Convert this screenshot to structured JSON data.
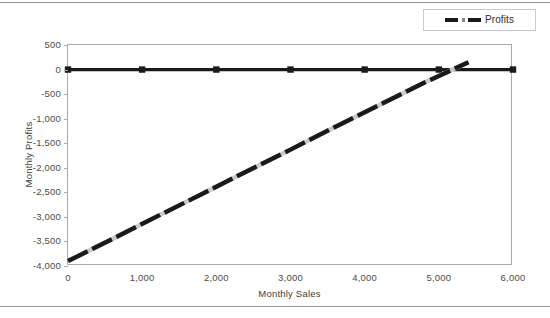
{
  "legend": {
    "position": "top-right",
    "entries": [
      {
        "label": "Profits",
        "marker": "dashed-line-swatch",
        "color": "#1a1a1a"
      }
    ]
  },
  "axes": {
    "x_title": "Monthly Sales",
    "y_title": "Monthly Profits",
    "x_ticks": [
      "0",
      "1,000",
      "2,000",
      "3,000",
      "4,000",
      "5,000",
      "6,000"
    ],
    "y_ticks": [
      "500",
      "0",
      "-500",
      "-1,000",
      "-1,500",
      "-2,000",
      "-2,500",
      "-3,000",
      "-3,500",
      "-4,000"
    ]
  },
  "chart_data": {
    "type": "line",
    "title": "",
    "xlabel": "Monthly Sales",
    "ylabel": "Monthly Profits",
    "xlim": [
      0,
      6000
    ],
    "ylim": [
      -4000,
      500
    ],
    "xticks": [
      0,
      1000,
      2000,
      3000,
      4000,
      5000,
      6000
    ],
    "yticks": [
      500,
      0,
      -500,
      -1000,
      -1500,
      -2000,
      -2500,
      -3000,
      -3500,
      -4000
    ],
    "xtick_labels": [
      "0",
      "1,000",
      "2,000",
      "3,000",
      "4,000",
      "5,000",
      "6,000"
    ],
    "ytick_labels": [
      "500",
      "0",
      "-500",
      "-1,000",
      "-1,500",
      "-2,000",
      "-2,500",
      "-3,000",
      "-3,500",
      "-4,000"
    ],
    "grid": false,
    "legend_position": "top-right",
    "series": [
      {
        "name": "Zero baseline",
        "style": "solid",
        "color": "#1a1a1a",
        "marker": "square",
        "x": [
          0,
          1000,
          2000,
          3000,
          4000,
          5000,
          6000
        ],
        "values": [
          0,
          0,
          0,
          0,
          0,
          0,
          0
        ]
      },
      {
        "name": "Profits",
        "style": "dashed",
        "color": "#1a1a1a",
        "marker": "none",
        "x": [
          0,
          600,
          1200,
          1800,
          2400,
          3000,
          3600,
          4200,
          4800,
          5400
        ],
        "values": [
          -3900,
          -3450,
          -2990,
          -2540,
          -2080,
          -1630,
          -1170,
          -720,
          -270,
          150
        ]
      }
    ],
    "annotations": [
      {
        "text": "break-even crossing",
        "x": 5100,
        "y": 0
      }
    ]
  }
}
